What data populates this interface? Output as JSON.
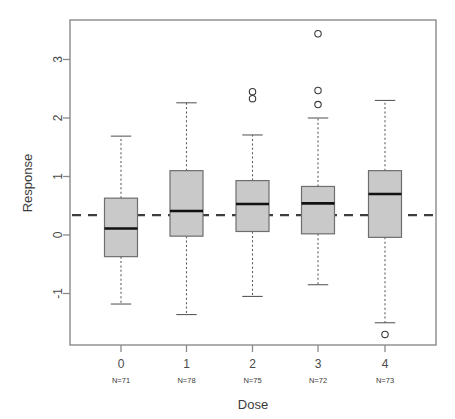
{
  "chart_data": {
    "type": "box",
    "title": "",
    "xlabel": "Dose",
    "ylabel": "Response",
    "categories": [
      "0",
      "1",
      "2",
      "3",
      "4"
    ],
    "group_counts": [
      "N=71",
      "N=78",
      "N=75",
      "N=72",
      "N=73"
    ],
    "ylim": [
      -1.9,
      3.7
    ],
    "yticks": [
      -1,
      0,
      1,
      2,
      3
    ],
    "ytick_labels": [
      "-1",
      "0",
      "1",
      "2",
      "3"
    ],
    "xticks": [
      0,
      1,
      2,
      3,
      4
    ],
    "grid": false,
    "legend": false,
    "reference_line": {
      "value": 0.34,
      "style": "dashed",
      "color": "#3d3d3d"
    },
    "boxes": [
      {
        "category": "0",
        "n": 71,
        "lower_whisker": -1.18,
        "q1": -0.37,
        "median": 0.11,
        "q3": 0.63,
        "upper_whisker": 1.69,
        "outliers": []
      },
      {
        "category": "1",
        "n": 78,
        "lower_whisker": -1.36,
        "q1": -0.02,
        "median": 0.41,
        "q3": 1.1,
        "upper_whisker": 2.26,
        "outliers": []
      },
      {
        "category": "2",
        "n": 75,
        "lower_whisker": -1.05,
        "q1": 0.06,
        "median": 0.53,
        "q3": 0.93,
        "upper_whisker": 1.71,
        "outliers": [
          2.45,
          2.33
        ]
      },
      {
        "category": "3",
        "n": 72,
        "lower_whisker": -0.85,
        "q1": 0.02,
        "median": 0.54,
        "q3": 0.83,
        "upper_whisker": 2.0,
        "outliers": [
          3.44,
          2.47,
          2.23
        ]
      },
      {
        "category": "4",
        "n": 73,
        "lower_whisker": -1.5,
        "q1": -0.04,
        "median": 0.7,
        "q3": 1.1,
        "upper_whisker": 2.3,
        "outliers": [
          -1.7
        ]
      }
    ],
    "colors": {
      "box_fill": "#c9c9c9",
      "box_border": "#6e6e6e",
      "median": "#111111",
      "whisker": "#5d5d5d",
      "reference": "#3d3d3d",
      "axis": "#8a8a8a",
      "text": "#3b3b3b",
      "background": "#ffffff"
    }
  }
}
